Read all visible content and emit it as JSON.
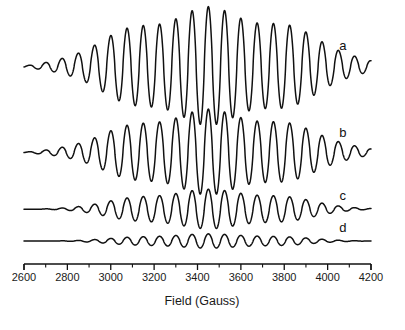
{
  "chart_data": {
    "type": "line",
    "title": "",
    "subtitle": "",
    "xlabel": "Field (Gauss)",
    "ylabel": "",
    "xlim": [
      2600,
      4200
    ],
    "xticks": [
      2600,
      2800,
      3000,
      3200,
      3400,
      3600,
      3800,
      4000,
      4200
    ],
    "xtick_labels": [
      "2600",
      "2800",
      "3000",
      "3200",
      "3400",
      "3600",
      "3800",
      "4000",
      "4200"
    ],
    "minor_ticks_between": 1,
    "grid": false,
    "legend_position": "inline-right",
    "line_color": "#111111",
    "background_color": "#ffffff",
    "annotation": "EPR derivative spectra with resolved hyperfine oscillations centered near 3450 G; amplitude decreases from trace a to trace d.",
    "hyperfine_spacing_gauss": 75,
    "center_field_gauss": 3450,
    "series": [
      {
        "name": "a",
        "label": "a",
        "amplitude_relative": 1.0,
        "envelope_width_gauss": 430,
        "baseline_px": 66,
        "peak_amplitude_px": 54,
        "label_x_gauss": 4070,
        "label_y_px": 50
      },
      {
        "name": "b",
        "label": "b",
        "amplitude_relative": 0.72,
        "envelope_width_gauss": 420,
        "baseline_px": 152,
        "peak_amplitude_px": 39,
        "label_x_gauss": 4070,
        "label_y_px": 137
      },
      {
        "name": "c",
        "label": "c",
        "amplitude_relative": 0.33,
        "envelope_width_gauss": 380,
        "baseline_px": 209,
        "peak_amplitude_px": 18,
        "label_x_gauss": 4070,
        "label_y_px": 200
      },
      {
        "name": "d",
        "label": "d",
        "amplitude_relative": 0.12,
        "envelope_width_gauss": 360,
        "baseline_px": 241,
        "peak_amplitude_px": 6.5,
        "label_x_gauss": 4070,
        "label_y_px": 232
      }
    ]
  },
  "axis": {
    "title": "Field (Gauss)",
    "tick_labels": [
      "2600",
      "2800",
      "3000",
      "3200",
      "3400",
      "3600",
      "3800",
      "4000",
      "4200"
    ]
  },
  "labels": {
    "a": "a",
    "b": "b",
    "c": "c",
    "d": "d"
  }
}
